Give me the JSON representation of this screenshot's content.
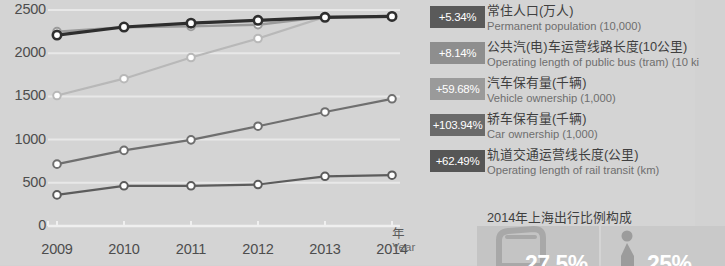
{
  "chart_data": {
    "type": "line",
    "title": "",
    "xlabel_cn": "年",
    "xlabel_en": "Year",
    "ylabel": "",
    "grid": true,
    "legend_position": "right",
    "ylim": [
      0,
      2500
    ],
    "yticks": [
      "0",
      "500",
      "1000",
      "1500",
      "2000",
      "2500"
    ],
    "categories": [
      "2009",
      "2010",
      "2011",
      "2012",
      "2013",
      "2014"
    ],
    "series": [
      {
        "name_cn": "常住人口(万人)",
        "name_en": "Permanent population (10,000)",
        "change": "+5.34%",
        "color": "#2e2e2e",
        "badge_color": "#5a5a5a",
        "values": [
          2210,
          2303,
          2347,
          2380,
          2415,
          2426
        ]
      },
      {
        "name_cn": "公共汽(电)车运营线路长度(10公里)",
        "name_en": "Operating length of public bus (tram) (10 ki",
        "change": "+8.14%",
        "color": "#9a9a9a",
        "badge_color": "#8e8e8e",
        "values": [
          2250,
          2300,
          2310,
          2330,
          2420,
          2430
        ]
      },
      {
        "name_cn": "汽车保有量(千辆)",
        "name_en": "Vehicle ownership (1,000)",
        "change": "+59.68%",
        "color": "#b8b8b8",
        "badge_color": "#9a9a9a",
        "values": [
          1510,
          1705,
          1950,
          2170,
          2420,
          2426
        ]
      },
      {
        "name_cn": "轿车保有量(千辆)",
        "name_en": "Car ownership (1,000)",
        "change": "+103.94%",
        "color": "#6f6f6f",
        "badge_color": "#6a6a6a",
        "values": [
          716,
          875,
          997,
          1155,
          1320,
          1472
        ]
      },
      {
        "name_cn": "轨道交通运营线长度(公里)",
        "name_en": "Operating length of rail transit (km)",
        "change": "+62.49%",
        "color": "#5c5c5c",
        "badge_color": "#565656",
        "values": [
          360,
          465,
          465,
          480,
          575,
          588
        ]
      }
    ]
  },
  "footer": {
    "title": "2014年上海出行比例构成",
    "items": [
      {
        "icon": "bus-icon",
        "percent": "27.5%"
      },
      {
        "icon": "pedestrian-icon",
        "percent": "25%"
      }
    ]
  }
}
